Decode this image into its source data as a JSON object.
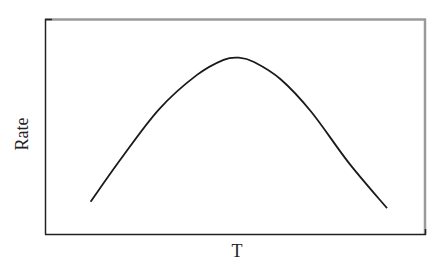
{
  "chart_data": {
    "type": "line",
    "title": "",
    "xlabel": "T",
    "ylabel": "Rate",
    "grid": false,
    "legend": null,
    "x_ticks": [],
    "y_ticks": [],
    "series": [
      {
        "name": "Rate vs T",
        "x": [
          0.12,
          0.2,
          0.3,
          0.4,
          0.47,
          0.51,
          0.55,
          0.62,
          0.7,
          0.8,
          0.9
        ],
        "y": [
          0.15,
          0.35,
          0.58,
          0.74,
          0.81,
          0.82,
          0.8,
          0.72,
          0.57,
          0.33,
          0.12
        ]
      }
    ],
    "xlim": [
      0,
      1
    ],
    "ylim": [
      0,
      1
    ]
  },
  "colors": {
    "curve": "#1a1a1a",
    "axis_dark": "#222222",
    "frame_light": "#9a9a9a"
  }
}
